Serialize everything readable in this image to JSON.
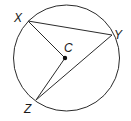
{
  "diagram": {
    "type": "circle-geometry",
    "circle": {
      "center": "C"
    },
    "points": [
      {
        "id": "X",
        "label": "X"
      },
      {
        "id": "Y",
        "label": "Y"
      },
      {
        "id": "Z",
        "label": "Z"
      },
      {
        "id": "C",
        "label": "C"
      }
    ],
    "segments": [
      "XY",
      "XC",
      "CZ",
      "YZ"
    ],
    "colors": {
      "stroke": "#2b2b2b",
      "background": "#ffffff"
    }
  }
}
